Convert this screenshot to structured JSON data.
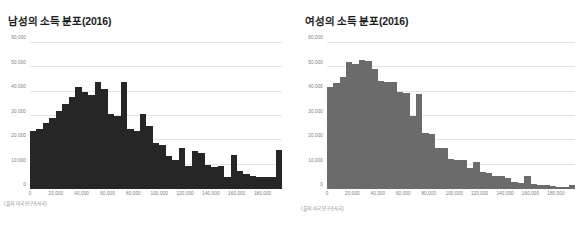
{
  "chart_data": [
    {
      "type": "bar",
      "id": "male-income-distribution",
      "title": "남성의 소득 분포(2016)",
      "source_note": "(출처: 미국 인구조사국)",
      "xlabel": "",
      "ylabel": "",
      "xlim": [
        0,
        195000
      ],
      "ylim": [
        0,
        60000
      ],
      "grid": true,
      "legend": "none",
      "bar_color": "#262626",
      "bin_width": 5000,
      "ytick_labels": [
        "60,000",
        "50,000",
        "40,000",
        "30,000",
        "20,000",
        "10,000",
        "0"
      ],
      "ytick_values": [
        60000,
        50000,
        40000,
        30000,
        20000,
        10000,
        0
      ],
      "xtick_labels": [
        "0",
        "20,000",
        "40,000",
        "60,000",
        "80,000",
        "100,000",
        "120,000",
        "140,000",
        "160,000",
        "180,000"
      ],
      "xtick_values": [
        0,
        20000,
        40000,
        60000,
        80000,
        100000,
        120000,
        140000,
        160000,
        180000
      ],
      "x": [
        2500,
        7500,
        12500,
        17500,
        22500,
        27500,
        32500,
        37500,
        42500,
        47500,
        52500,
        57500,
        62500,
        67500,
        72500,
        77500,
        82500,
        87500,
        92500,
        97500,
        102500,
        107500,
        112500,
        117500,
        122500,
        127500,
        132500,
        137500,
        142500,
        147500,
        152500,
        157500,
        162500,
        167500,
        172500,
        177500,
        182500,
        187500,
        192500
      ],
      "values": [
        24000,
        24500,
        27000,
        29000,
        32000,
        35000,
        38000,
        42000,
        40000,
        38500,
        44000,
        41000,
        31000,
        30000,
        44000,
        24500,
        24000,
        31000,
        26000,
        19000,
        18000,
        13500,
        12000,
        17000,
        9500,
        15500,
        15000,
        10000,
        9000,
        9500,
        5000,
        14000,
        7500,
        6000,
        5500,
        5000,
        5000,
        5000,
        16000
      ]
    },
    {
      "type": "bar",
      "id": "female-income-distribution",
      "title": "여성의 소득 분포(2016)",
      "source_note": "(출처: 미국 인구조사국)",
      "xlabel": "",
      "ylabel": "",
      "xlim": [
        0,
        195000
      ],
      "ylim": [
        0,
        60000
      ],
      "grid": true,
      "legend": "none",
      "bar_color": "#6b6b6b",
      "bin_width": 5000,
      "ytick_labels": [
        "60,000",
        "50,000",
        "40,000",
        "30,000",
        "20,000",
        "10,000",
        "0"
      ],
      "ytick_values": [
        60000,
        50000,
        40000,
        30000,
        20000,
        10000,
        0
      ],
      "xtick_labels": [
        "0",
        "20,000",
        "40,000",
        "60,000",
        "80,000",
        "100,000",
        "120,000",
        "140,000",
        "160,000",
        "180,000"
      ],
      "xtick_values": [
        0,
        20000,
        40000,
        60000,
        80000,
        100000,
        120000,
        140000,
        160000,
        180000
      ],
      "x": [
        2500,
        7500,
        12500,
        17500,
        22500,
        27500,
        32500,
        37500,
        42500,
        47500,
        52500,
        57500,
        62500,
        67500,
        72500,
        77500,
        82500,
        87500,
        92500,
        97500,
        102500,
        107500,
        112500,
        117500,
        122500,
        127500,
        132500,
        137500,
        142500,
        147500,
        152500,
        157500,
        162500,
        167500,
        172500,
        177500,
        182500,
        187500,
        192500
      ],
      "values": [
        42000,
        43500,
        46000,
        52000,
        51500,
        53000,
        52500,
        49500,
        44500,
        44000,
        44000,
        40000,
        39500,
        30000,
        39000,
        23000,
        22500,
        17000,
        17000,
        12500,
        12000,
        12000,
        8500,
        11000,
        7000,
        6500,
        5500,
        5500,
        4500,
        3000,
        2500,
        5500,
        2000,
        1800,
        1500,
        1200,
        1000,
        900,
        1800
      ]
    }
  ]
}
